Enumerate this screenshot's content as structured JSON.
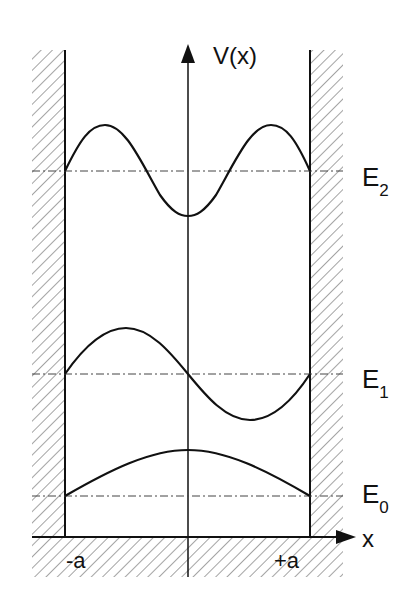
{
  "diagram": {
    "y_axis_label": "V(x)",
    "x_axis_label": "x",
    "x_ticks": {
      "left": "-a",
      "right": "+a"
    },
    "levels": [
      {
        "name": "E",
        "sub": "0",
        "n": 0
      },
      {
        "name": "E",
        "sub": "1",
        "n": 1
      },
      {
        "name": "E",
        "sub": "2",
        "n": 2
      }
    ],
    "colors": {
      "line": "#111111",
      "hatch": "#555555",
      "background": "#ffffff"
    }
  }
}
